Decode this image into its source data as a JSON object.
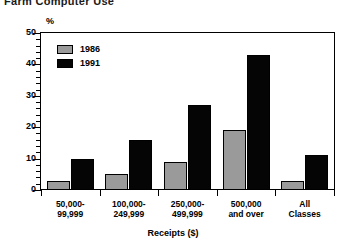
{
  "chart_data": {
    "type": "bar",
    "title": "Farm Computer Use",
    "xlabel": "Receipts ($)",
    "ylabel": "%",
    "categories": [
      "50,000-\n99,999",
      "100,000-\n249,999",
      "250,000-\n499,999",
      "500,000\nand over",
      "All\nClasses"
    ],
    "series": [
      {
        "name": "1986",
        "color": "#9a9a9a",
        "values": [
          3,
          5,
          9,
          19,
          3
        ]
      },
      {
        "name": "1991",
        "color": "#050505",
        "values": [
          10,
          16,
          27,
          43,
          11
        ]
      }
    ],
    "ylim": [
      0,
      50
    ],
    "yticks": [
      0,
      10,
      20,
      30,
      40,
      50
    ],
    "ytick_labels": [
      "0",
      "10",
      "20",
      "30",
      "40",
      "50"
    ],
    "yminor_step": 2,
    "grid": false,
    "legend_position": "top-left"
  }
}
